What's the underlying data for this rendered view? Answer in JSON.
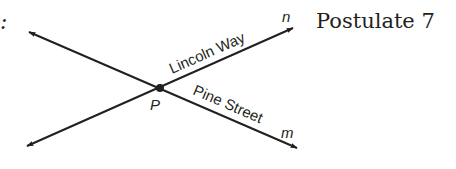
{
  "diagram": {
    "leading_text_fragment": ":",
    "postulate_label": "Postulate 7",
    "point": {
      "label": "P",
      "x": 160,
      "y": 88
    },
    "lines": [
      {
        "name": "n",
        "street_label": "Lincoln Way",
        "from": [
          27,
          146
        ],
        "to": [
          293,
          28
        ]
      },
      {
        "name": "m",
        "street_label": "Pine Street",
        "from": [
          29,
          32
        ],
        "to": [
          297,
          148
        ]
      }
    ],
    "colors": {
      "ink": "#231f20",
      "background": "#ffffff"
    }
  }
}
